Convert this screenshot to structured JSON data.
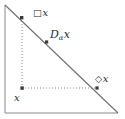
{
  "figure": {
    "type": "geometric-diagram",
    "stroke_color": "#6f6f6f",
    "dot_color": "#3a3a3a",
    "text_color": "#2b2b2b",
    "background_color": "#ffffff"
  },
  "labels": {
    "box_x": {
      "operator": "□",
      "variable": "x"
    },
    "d_alpha_x": {
      "operator": "D",
      "subscript": "α",
      "variable": "x"
    },
    "diamond_x": {
      "operator": "◇",
      "variable": "x"
    },
    "x": {
      "variable": "x"
    }
  },
  "geometry": {
    "triangle": {
      "apex_top_left": [
        5,
        5
      ],
      "corner_bottom_left": [
        5,
        113
      ],
      "corner_bottom_right": [
        118,
        113
      ],
      "legs": [
        "left-vertical",
        "bottom-horizontal"
      ],
      "hypotenuse": "top-left to bottom-right"
    },
    "points": [
      {
        "name": "box-x-point",
        "at": [
          22,
          18
        ],
        "on": "hypotenuse"
      },
      {
        "name": "d-alpha-x-point",
        "at": [
          47,
          42
        ],
        "on": "hypotenuse"
      },
      {
        "name": "diamond-x-point",
        "at": [
          97,
          88
        ],
        "on": "hypotenuse"
      },
      {
        "name": "x-point",
        "at": [
          22,
          88
        ],
        "on": "interior"
      }
    ],
    "dotted_guides": [
      {
        "name": "vertical-guide",
        "from": [
          22,
          18
        ],
        "to": [
          22,
          88
        ]
      },
      {
        "name": "horizontal-guide",
        "from": [
          22,
          88
        ],
        "to": [
          97,
          88
        ]
      }
    ]
  }
}
